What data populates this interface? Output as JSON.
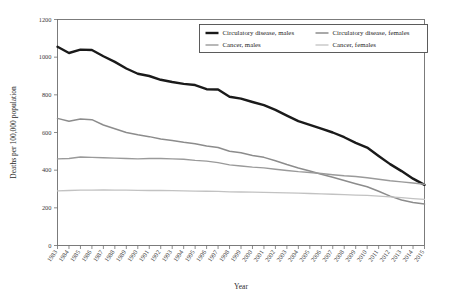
{
  "chart_data": {
    "type": "line",
    "title": "",
    "xlabel": "Year",
    "ylabel": "Deaths per 100,000 population",
    "ylim": [
      0,
      1200
    ],
    "ytick_labels": [
      "0",
      "200",
      "400",
      "600",
      "800",
      "1000",
      "1200"
    ],
    "yticks": [
      0,
      200,
      400,
      600,
      800,
      1000,
      1200
    ],
    "grid": false,
    "legend_position": "top-center",
    "x": [
      1983,
      1984,
      1985,
      1986,
      1987,
      1988,
      1989,
      1990,
      1991,
      1992,
      1993,
      1994,
      1995,
      1996,
      1997,
      1998,
      1999,
      2000,
      2001,
      2002,
      2003,
      2004,
      2005,
      2006,
      2007,
      2008,
      2009,
      2010,
      2011,
      2012,
      2013,
      2014,
      2015
    ],
    "categories": [
      "1983",
      "1984",
      "1985",
      "1986",
      "1987",
      "1988",
      "1989",
      "1990",
      "1991",
      "1992",
      "1993",
      "1994",
      "1995",
      "1996",
      "1997",
      "1998",
      "1999",
      "2000",
      "2001",
      "2002",
      "2003",
      "2004",
      "2005",
      "2006",
      "2007",
      "2008",
      "2009",
      "2010",
      "2011",
      "2012",
      "2013",
      "2014",
      "2015"
    ],
    "series": [
      {
        "name": "Circulatory disease, males",
        "color": "#1a1a1a",
        "width": 2.4,
        "values": [
          1055,
          1022,
          1040,
          1038,
          1005,
          975,
          940,
          912,
          900,
          880,
          868,
          858,
          852,
          830,
          828,
          790,
          780,
          762,
          745,
          720,
          690,
          660,
          640,
          620,
          600,
          575,
          545,
          520,
          475,
          432,
          395,
          355,
          322
        ]
      },
      {
        "name": "Circulatory disease, females",
        "color": "#8c8c8c",
        "width": 1.5,
        "values": [
          675,
          660,
          672,
          668,
          640,
          620,
          600,
          588,
          578,
          565,
          558,
          548,
          540,
          528,
          520,
          500,
          492,
          478,
          468,
          450,
          430,
          412,
          396,
          378,
          362,
          345,
          328,
          312,
          288,
          262,
          242,
          228,
          220
        ]
      },
      {
        "name": "Cancer, males",
        "color": "#9a9a9a",
        "width": 1.4,
        "values": [
          460,
          462,
          470,
          468,
          466,
          464,
          462,
          460,
          462,
          462,
          460,
          458,
          452,
          448,
          440,
          428,
          422,
          416,
          412,
          405,
          398,
          392,
          388,
          382,
          376,
          370,
          366,
          360,
          352,
          344,
          338,
          332,
          325
        ]
      },
      {
        "name": "Cancer, females",
        "color": "#c2c2c2",
        "width": 1.3,
        "values": [
          290,
          292,
          294,
          294,
          295,
          294,
          294,
          293,
          292,
          292,
          291,
          290,
          289,
          288,
          287,
          285,
          284,
          283,
          282,
          281,
          279,
          278,
          276,
          274,
          272,
          270,
          268,
          266,
          262,
          258,
          254,
          249,
          245
        ]
      }
    ],
    "legend": [
      {
        "label": "Circulatory disease, males",
        "color": "#1a1a1a",
        "width": 2.4
      },
      {
        "label": "Circulatory disease, females",
        "color": "#8c8c8c",
        "width": 1.5
      },
      {
        "label": "Cancer, males",
        "color": "#9a9a9a",
        "width": 1.4
      },
      {
        "label": "Cancer, females",
        "color": "#c2c2c2",
        "width": 1.3
      }
    ]
  }
}
